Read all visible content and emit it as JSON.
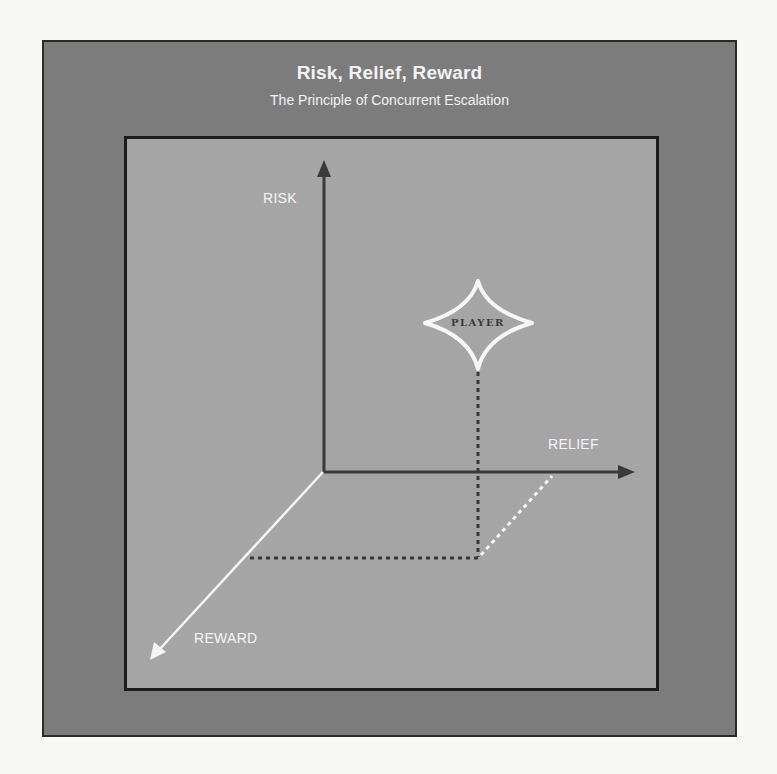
{
  "header": {
    "title": "Risk, Relief, Reward",
    "subtitle": "The Principle of Concurrent Escalation"
  },
  "axes": {
    "risk_label": "RISK",
    "relief_label": "RELIEF",
    "reward_label": "REWARD"
  },
  "marker": {
    "label": "PLAYER",
    "shape": "four-point-star-icon"
  },
  "colors": {
    "frame": "#7c7c7c",
    "panel": "#a5a5a5",
    "axis_dark": "#3a3a3a",
    "axis_light": "#f4f4f4",
    "border": "#1c1c1c"
  }
}
